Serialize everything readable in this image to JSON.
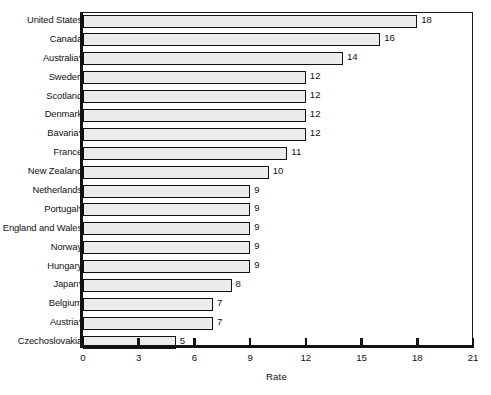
{
  "chart_data": {
    "type": "bar",
    "orientation": "horizontal",
    "title": "",
    "xlabel": "Rate",
    "ylabel": "",
    "xlim": [
      0,
      21
    ],
    "xticks": [
      0,
      3,
      6,
      9,
      12,
      15,
      18,
      21
    ],
    "grid": false,
    "legend": null,
    "categories": [
      "United States",
      "Canada",
      "Australia*",
      "Sweden",
      "Scotland",
      "Denmark",
      "Bavaria*",
      "France",
      "New Zealand",
      "Netherlands",
      "Portugal*",
      "England and Wales",
      "Norway",
      "Hungary",
      "Japan*",
      "Belgium",
      "Austria*",
      "Czechoslovakia"
    ],
    "values": [
      18,
      16,
      14,
      12,
      12,
      12,
      12,
      11,
      10,
      9,
      9,
      9,
      9,
      9,
      8,
      7,
      7,
      5
    ],
    "value_labels": [
      "18",
      "16",
      "14",
      "12",
      "12",
      "12",
      "12",
      "11",
      "10",
      "9",
      "9",
      "9",
      "9",
      "9",
      "8",
      "7",
      "7",
      "5"
    ],
    "bar_fill": "#e9e9e9",
    "bar_edge": "#111111"
  },
  "axis": {
    "x_title": "Rate",
    "tick_labels": [
      "0",
      "3",
      "6",
      "9",
      "12",
      "15",
      "18",
      "21"
    ]
  }
}
